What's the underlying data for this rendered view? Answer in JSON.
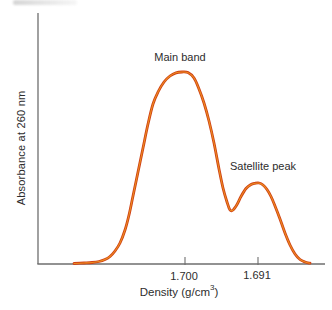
{
  "figure": {
    "background": "#ffffff"
  },
  "chart_data": {
    "type": "line",
    "title": "",
    "ylabel": "Absorbance at 260 nm",
    "xlabel": "Density (g/cm³)",
    "xlabel_parts": {
      "pre": "Density (g/cm",
      "sup": "3",
      "post": ")"
    },
    "x_ticks": [
      {
        "label": "1.700",
        "px": 185
      },
      {
        "label": "1.691",
        "px": 258
      }
    ],
    "annotations": {
      "main_band": "Main band",
      "satellite_peak": "Satellite peak"
    },
    "peaks": [
      {
        "name": "Main band",
        "density": 1.7,
        "relative_absorbance": 1.0
      },
      {
        "name": "Satellite peak",
        "density": 1.691,
        "relative_absorbance": 0.42
      }
    ],
    "valley": {
      "relative_absorbance": 0.28
    },
    "grid": false,
    "legend": "none",
    "axis": {
      "origin_x": 38,
      "baseline_y": 264,
      "y_top": 13,
      "x_right": 325,
      "tick_len": 7
    },
    "colors": {
      "curve": "#cf4016",
      "curve_core": "#ef9420",
      "axis": "#6e6e6e",
      "text": "#2d2d2d"
    },
    "curve_px": [
      [
        74,
        263.5
      ],
      [
        84,
        263
      ],
      [
        92,
        262.5
      ],
      [
        99,
        261.5
      ],
      [
        105,
        259.5
      ],
      [
        110,
        256.5
      ],
      [
        115,
        251
      ],
      [
        120,
        243
      ],
      [
        125,
        230
      ],
      [
        129,
        215
      ],
      [
        133,
        196
      ],
      [
        138,
        172
      ],
      [
        143,
        148
      ],
      [
        148,
        124
      ],
      [
        153,
        104
      ],
      [
        158,
        92
      ],
      [
        164,
        82
      ],
      [
        170,
        76
      ],
      [
        176,
        72.8
      ],
      [
        182,
        72
      ],
      [
        188,
        72.6
      ],
      [
        194,
        78
      ],
      [
        199,
        89
      ],
      [
        204,
        103
      ],
      [
        209,
        121
      ],
      [
        214,
        143
      ],
      [
        219,
        169
      ],
      [
        223,
        188
      ],
      [
        227,
        202
      ],
      [
        230,
        210
      ],
      [
        233,
        210
      ],
      [
        237,
        204.5
      ],
      [
        241,
        196.5
      ],
      [
        246,
        188.5
      ],
      [
        251,
        184.5
      ],
      [
        255,
        183.3
      ],
      [
        259,
        183
      ],
      [
        263,
        185
      ],
      [
        267,
        189.5
      ],
      [
        271,
        196.5
      ],
      [
        275,
        206
      ],
      [
        280,
        219
      ],
      [
        285,
        233
      ],
      [
        290,
        245
      ],
      [
        295,
        254
      ],
      [
        300,
        259.5
      ],
      [
        305,
        262
      ],
      [
        310,
        263.2
      ]
    ]
  }
}
